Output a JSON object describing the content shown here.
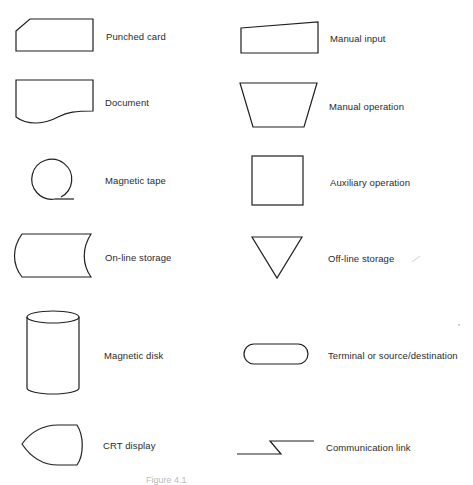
{
  "diagram": {
    "type": "flowchart-symbol-legend",
    "line_color": "#1f1f1f",
    "symbols_left": [
      {
        "id": "punched-card",
        "label": "Punched card"
      },
      {
        "id": "document",
        "label": "Document"
      },
      {
        "id": "magnetic-tape",
        "label": "Magnetic tape"
      },
      {
        "id": "on-line-storage",
        "label": "On-line storage"
      },
      {
        "id": "magnetic-disk",
        "label": "Magnetic disk"
      },
      {
        "id": "crt-display",
        "label": "CRT display"
      }
    ],
    "symbols_right": [
      {
        "id": "manual-input",
        "label": "Manual input"
      },
      {
        "id": "manual-operation",
        "label": "Manual operation"
      },
      {
        "id": "auxiliary-operation",
        "label": "Auxiliary operation"
      },
      {
        "id": "off-line-storage",
        "label": "Off-line storage"
      },
      {
        "id": "terminal",
        "label": "Terminal or source/destination"
      },
      {
        "id": "communication-link",
        "label": "Communication link"
      }
    ],
    "caption": "Figure 4.1"
  }
}
